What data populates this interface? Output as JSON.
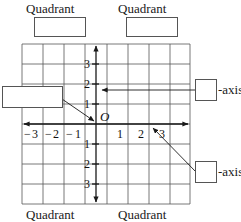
{
  "figure": {
    "title_text": "Coordinate plane quadrant and axis labeling exercise",
    "origin_label": "O",
    "grid": {
      "cols": 8,
      "rows": 8,
      "cell_px": 21,
      "left_px": 22,
      "top_px": 44,
      "origin_x_px": 96,
      "origin_y_px": 124
    }
  },
  "quadrant_labels": {
    "top_left": "Quadrant",
    "top_right": "Quadrant",
    "bottom_left": "Quadrant",
    "bottom_right": "Quadrant"
  },
  "axis_callouts": {
    "upper": "-axis",
    "lower": "-axis"
  },
  "ticks": {
    "y_positive": [
      "3",
      "2",
      "1"
    ],
    "y_negative": [
      "1",
      "2",
      "3"
    ],
    "x_negative": [
      "3",
      "2",
      "1"
    ],
    "x_positive": [
      "1",
      "2",
      "3"
    ],
    "minus_sign": "−"
  },
  "answer_boxes": {
    "quadrant_top_left": "",
    "quadrant_top_right": "",
    "axis_upper_right": "",
    "axis_lower_right": "",
    "origin_callout_left": ""
  },
  "colors": {
    "ink": "#1a1a1a",
    "grid": "#555555",
    "paper": "#ffffff"
  }
}
